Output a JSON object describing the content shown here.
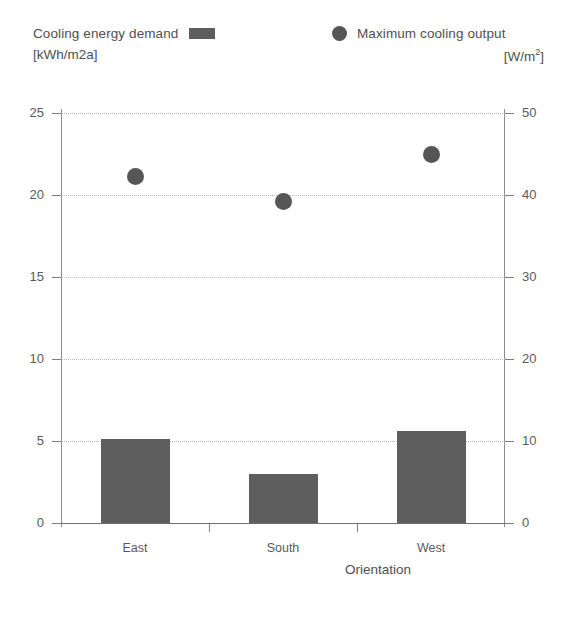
{
  "legend": {
    "series_bar": {
      "label": "Cooling energy demand",
      "unit": "[kWh/m2a]",
      "marker": "square-swatch",
      "color": "#5e5e5e"
    },
    "series_dot": {
      "label": "Maximum cooling output",
      "unit_prefix": "[W/m",
      "unit_sup": "2",
      "unit_suffix": "]",
      "marker": "circle-swatch",
      "color": "#565656"
    }
  },
  "chart_data": {
    "type": "bar",
    "title": "",
    "xlabel": "Orientation",
    "categories": [
      "East",
      "South",
      "West"
    ],
    "series": [
      {
        "name": "Cooling energy demand",
        "unit": "kWh/m2a",
        "type": "bar",
        "axis": "left",
        "color": "#5e5e5e",
        "values": [
          5.1,
          3.0,
          5.6
        ]
      },
      {
        "name": "Maximum cooling output",
        "unit": "W/m2",
        "type": "scatter",
        "axis": "right",
        "color": "#565656",
        "values": [
          42.2,
          39.2,
          45.0
        ]
      }
    ],
    "left_axis": {
      "label": "[kWh/m2a]",
      "ticks": [
        0,
        5,
        10,
        15,
        20,
        25
      ],
      "ylim": [
        0,
        25
      ]
    },
    "right_axis": {
      "label": "[W/m2]",
      "ticks": [
        0,
        10,
        20,
        30,
        40,
        50
      ],
      "ylim": [
        0,
        50
      ]
    },
    "grid": true,
    "legend_position": "top"
  }
}
